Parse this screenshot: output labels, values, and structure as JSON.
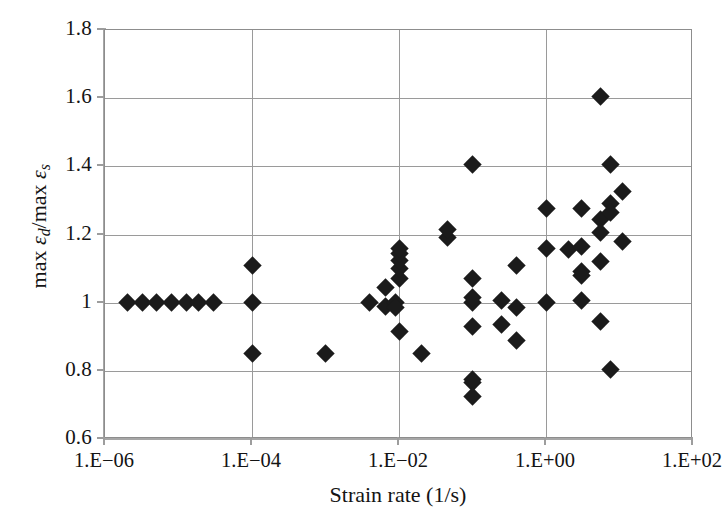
{
  "chart_data": {
    "type": "scatter",
    "title": "",
    "xlabel": "Strain rate (1/s)",
    "ylabel": "max εd/max εs",
    "ylabel_parts": {
      "prefix1": "max ",
      "eps1": "ε",
      "sub1": "d",
      "slash": "/max ",
      "eps2": "ε",
      "sub2": "s"
    },
    "xscale": "log",
    "yscale": "linear",
    "xlim": [
      1e-06,
      100.0
    ],
    "ylim": [
      0.6,
      1.8
    ],
    "grid": true,
    "legend": "none",
    "marker": "diamond",
    "marker_color": "#1b1b1b",
    "xticks": [
      1e-06,
      0.0001,
      0.01,
      1,
      100
    ],
    "xtick_labels": [
      "1.E−06",
      "1.E−04",
      "1.E−02",
      "1.E+00",
      "1.E+02"
    ],
    "yticks": [
      0.6,
      0.8,
      1.0,
      1.2,
      1.4,
      1.6,
      1.8
    ],
    "ytick_labels": [
      "0.6",
      "0.8",
      "1",
      "1.2",
      "1.4",
      "1.6",
      "1.8"
    ],
    "points": [
      {
        "x": 2e-06,
        "y": 1.0
      },
      {
        "x": 3.2e-06,
        "y": 1.0
      },
      {
        "x": 5e-06,
        "y": 1.0
      },
      {
        "x": 8e-06,
        "y": 1.0
      },
      {
        "x": 1.3e-05,
        "y": 1.0
      },
      {
        "x": 1.9e-05,
        "y": 1.0
      },
      {
        "x": 3e-05,
        "y": 1.0
      },
      {
        "x": 0.0001,
        "y": 1.0
      },
      {
        "x": 0.0001,
        "y": 1.11
      },
      {
        "x": 0.0001,
        "y": 0.85
      },
      {
        "x": 0.001,
        "y": 0.85
      },
      {
        "x": 0.004,
        "y": 1.0
      },
      {
        "x": 0.0065,
        "y": 1.045
      },
      {
        "x": 0.0065,
        "y": 0.99
      },
      {
        "x": 0.009,
        "y": 1.0
      },
      {
        "x": 0.009,
        "y": 0.985
      },
      {
        "x": 0.01,
        "y": 0.915
      },
      {
        "x": 0.01,
        "y": 1.07
      },
      {
        "x": 0.01,
        "y": 1.1
      },
      {
        "x": 0.01,
        "y": 1.125
      },
      {
        "x": 0.01,
        "y": 1.145
      },
      {
        "x": 0.01,
        "y": 1.16
      },
      {
        "x": 0.02,
        "y": 0.85
      },
      {
        "x": 0.045,
        "y": 1.19
      },
      {
        "x": 0.045,
        "y": 1.215
      },
      {
        "x": 0.1,
        "y": 1.405
      },
      {
        "x": 0.1,
        "y": 1.07
      },
      {
        "x": 0.1,
        "y": 1.0
      },
      {
        "x": 0.1,
        "y": 1.015
      },
      {
        "x": 0.1,
        "y": 0.93
      },
      {
        "x": 0.1,
        "y": 0.775
      },
      {
        "x": 0.1,
        "y": 0.765
      },
      {
        "x": 0.1,
        "y": 0.725
      },
      {
        "x": 0.25,
        "y": 1.005
      },
      {
        "x": 0.25,
        "y": 0.935
      },
      {
        "x": 0.4,
        "y": 1.11
      },
      {
        "x": 0.4,
        "y": 0.985
      },
      {
        "x": 0.4,
        "y": 0.89
      },
      {
        "x": 1.0,
        "y": 1.275
      },
      {
        "x": 1.0,
        "y": 1.16
      },
      {
        "x": 1.0,
        "y": 1.0
      },
      {
        "x": 2.0,
        "y": 1.155
      },
      {
        "x": 3.0,
        "y": 1.275
      },
      {
        "x": 3.0,
        "y": 1.165
      },
      {
        "x": 3.0,
        "y": 1.09
      },
      {
        "x": 3.0,
        "y": 1.08
      },
      {
        "x": 3.0,
        "y": 1.005
      },
      {
        "x": 5.5,
        "y": 1.605
      },
      {
        "x": 5.5,
        "y": 1.245
      },
      {
        "x": 5.5,
        "y": 1.12
      },
      {
        "x": 5.5,
        "y": 1.205
      },
      {
        "x": 5.5,
        "y": 0.945
      },
      {
        "x": 7.5,
        "y": 1.405
      },
      {
        "x": 7.5,
        "y": 1.29
      },
      {
        "x": 7.5,
        "y": 1.265
      },
      {
        "x": 7.5,
        "y": 0.805
      },
      {
        "x": 11.0,
        "y": 1.325
      },
      {
        "x": 11.0,
        "y": 1.18
      }
    ]
  }
}
